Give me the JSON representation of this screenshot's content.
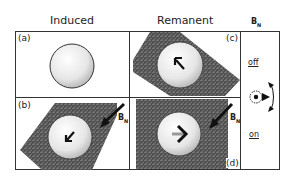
{
  "headers": {
    "induced": "Induced",
    "remanent": "Remanent",
    "bn": "B",
    "bn_sub": "N"
  },
  "panels": {
    "a": "(a)",
    "b": "(b)",
    "c": "(c)",
    "d": "(d)"
  },
  "arrow_labels": {
    "b": "B",
    "b_sub": "N",
    "d": "B",
    "d_sub": "N"
  },
  "side": {
    "off": "off",
    "on": "on"
  },
  "colors": {
    "border": "#333333",
    "texture": "#5a5a5a",
    "sphere": "#e8e8e8"
  }
}
